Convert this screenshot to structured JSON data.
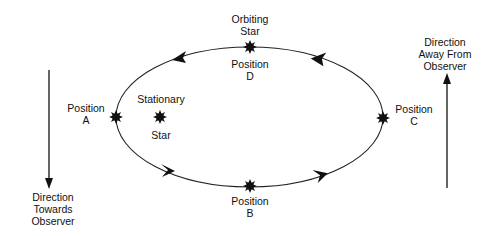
{
  "labels": {
    "orbiting": [
      "Orbiting",
      "Star"
    ],
    "position_d": [
      "Position",
      "D"
    ],
    "position_a": [
      "Position",
      "A"
    ],
    "position_b": [
      "Position",
      "B"
    ],
    "position_c": [
      "Position",
      "C"
    ],
    "stationary": "Stationary",
    "star": "Star",
    "towards": [
      "Direction",
      "Towards",
      "Observer"
    ],
    "away": [
      "Direction",
      "Away From",
      "Observer"
    ]
  },
  "colors": {
    "ink": "#111111",
    "background": "#ffffff"
  }
}
